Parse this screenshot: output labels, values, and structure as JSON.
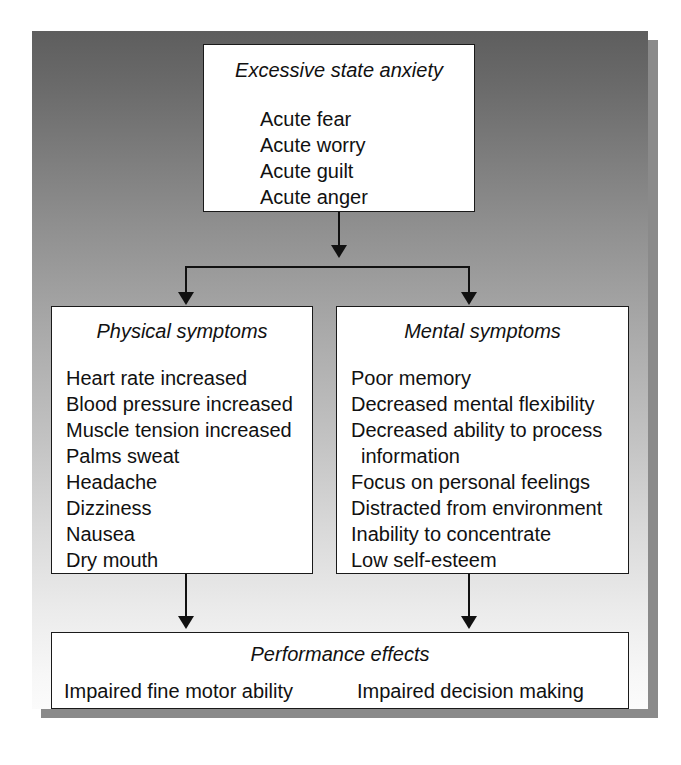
{
  "diagram": {
    "type": "flowchart",
    "boxes": {
      "anxiety": {
        "title": "Excessive state anxiety",
        "items": [
          "Acute fear",
          "Acute worry",
          "Acute guilt",
          "Acute anger"
        ]
      },
      "physical": {
        "title": "Physical symptoms",
        "items": [
          "Heart rate increased",
          "Blood pressure increased",
          "Muscle tension increased",
          "Palms sweat",
          "Headache",
          "Dizziness",
          "Nausea",
          "Dry mouth"
        ]
      },
      "mental": {
        "title": "Mental symptoms",
        "items": [
          "Poor memory",
          "Decreased mental flexibility",
          "Decreased ability to process",
          "information",
          "Focus on personal feelings",
          "Distracted from environment",
          "Inability to concentrate",
          "Low self-esteem"
        ]
      },
      "performance": {
        "title": "Performance effects",
        "effect_left": "Impaired fine motor ability",
        "effect_right": "Impaired decision making"
      }
    },
    "connectors": [
      {
        "from": "anxiety",
        "to": "split",
        "style": "arrow-down"
      },
      {
        "from": "split",
        "to": "physical",
        "style": "arrow-down"
      },
      {
        "from": "split",
        "to": "mental",
        "style": "arrow-down"
      },
      {
        "from": "physical",
        "to": "performance",
        "style": "arrow-down"
      },
      {
        "from": "mental",
        "to": "performance",
        "style": "arrow-down"
      }
    ],
    "colors": {
      "box_fill": "#ffffff",
      "box_border": "#1a1a1a",
      "text": "#111111",
      "frame_gradient_top": "#5e5e5e",
      "frame_gradient_bottom": "#fbfbfb",
      "shadow": "#8a8a8a",
      "page_background": "#ffffff"
    }
  }
}
